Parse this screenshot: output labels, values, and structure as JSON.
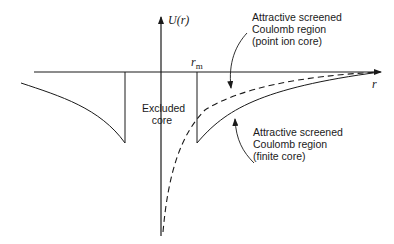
{
  "diagram": {
    "type": "potential-energy-schematic",
    "y_axis_label": "U(r)",
    "x_axis_label": "r",
    "marker_label": "r",
    "marker_subscript": "m",
    "excluded_core": [
      "Excluded",
      "core"
    ],
    "annotation_point_ion": [
      "Attractive screened",
      "Coulomb region",
      "(point ion core)"
    ],
    "annotation_finite_core": [
      "Attractive screened",
      "Coulomb region",
      "(finite core)"
    ],
    "curves": [
      {
        "name": "finite-core potential",
        "style": "solid"
      },
      {
        "name": "point-ion-core potential",
        "style": "dashed"
      }
    ],
    "colors": {
      "ink": "#1a1a1a",
      "background": "#ffffff"
    }
  }
}
